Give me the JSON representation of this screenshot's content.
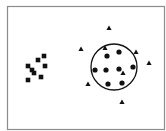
{
  "diagram": {
    "colors": {
      "background": "#ffffff",
      "frame": "#8c8c8c",
      "marks": "#111111"
    },
    "frame": {
      "x": 7,
      "y": 6,
      "width": 157,
      "height": 123
    },
    "enclosing_circle": {
      "cx": 114,
      "cy": 67,
      "r": 23
    },
    "squares": [
      {
        "x": 44,
        "y": 56
      },
      {
        "x": 38,
        "y": 60
      },
      {
        "x": 28,
        "y": 66
      },
      {
        "x": 45,
        "y": 66
      },
      {
        "x": 32,
        "y": 70
      },
      {
        "x": 34,
        "y": 73
      },
      {
        "x": 41,
        "y": 77
      },
      {
        "x": 28,
        "y": 80
      }
    ],
    "dots": [
      {
        "x": 107,
        "y": 56
      },
      {
        "x": 119,
        "y": 52
      },
      {
        "x": 95,
        "y": 70
      },
      {
        "x": 106,
        "y": 70
      },
      {
        "x": 119,
        "y": 69
      },
      {
        "x": 133,
        "y": 67
      },
      {
        "x": 108,
        "y": 84
      },
      {
        "x": 122,
        "y": 83
      }
    ],
    "triangles": [
      {
        "x": 109,
        "y": 28
      },
      {
        "x": 81,
        "y": 49
      },
      {
        "x": 105,
        "y": 48
      },
      {
        "x": 136,
        "y": 52
      },
      {
        "x": 149,
        "y": 63
      },
      {
        "x": 123,
        "y": 73
      },
      {
        "x": 88,
        "y": 84
      },
      {
        "x": 122,
        "y": 102
      }
    ]
  }
}
